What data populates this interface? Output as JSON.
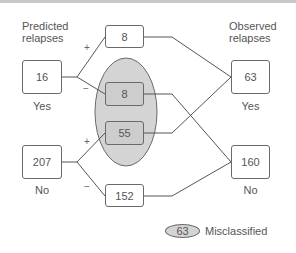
{
  "headers": {
    "predicted": "Predicted\nrelapses",
    "predicted_line1": "Predicted",
    "predicted_line2": "relapses",
    "observed_line1": "Observed",
    "observed_line2": "relapses"
  },
  "predicted": {
    "yes": {
      "value": "16",
      "label": "Yes"
    },
    "no": {
      "value": "207",
      "label": "No"
    }
  },
  "middle": {
    "yes_plus": {
      "value": "8",
      "sign": "+"
    },
    "yes_minus": {
      "value": "8",
      "sign": "−",
      "misclassified": true
    },
    "no_plus": {
      "value": "55",
      "sign": "+",
      "misclassified": true
    },
    "no_minus": {
      "value": "152",
      "sign": "−"
    }
  },
  "observed": {
    "yes": {
      "value": "63",
      "label": "Yes"
    },
    "no": {
      "value": "160",
      "label": "No"
    }
  },
  "legend": {
    "value": "63",
    "label": "Misclassified"
  },
  "colors": {
    "line": "#555555",
    "misclassified_fill": "#d4d4d4",
    "box_border": "#6a6a6a"
  }
}
